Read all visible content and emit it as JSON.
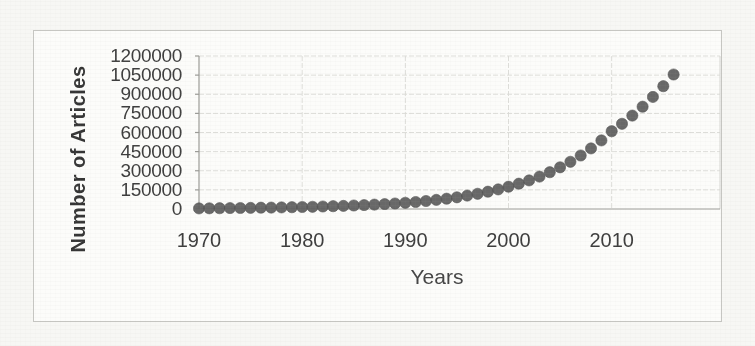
{
  "figure": {
    "page_background": "#f7f7f4",
    "frame_background": "#fcfcfa",
    "frame_border_color": "#c6c6c2"
  },
  "chart_data": {
    "type": "scatter",
    "title": "",
    "xlabel": "Years",
    "ylabel": "Number of Articles",
    "x_tick_labels": [
      "1970",
      "1980",
      "1990",
      "2000",
      "2010"
    ],
    "x_ticks": [
      1970,
      1980,
      1990,
      2000,
      2010
    ],
    "y_ticks": [
      0,
      150000,
      300000,
      450000,
      600000,
      750000,
      900000,
      1050000,
      1200000
    ],
    "y_tick_labels": [
      "0",
      "150000",
      "300000",
      "450000",
      "600000",
      "750000",
      "900000",
      "1050000",
      "1200000"
    ],
    "xlim": [
      1970,
      2020.5
    ],
    "ylim": [
      0,
      1200000
    ],
    "grid": true,
    "legend": "none",
    "marker_color": "#5d5d5d",
    "marker_edge_color": "#4e4e4e",
    "gridline_color": "#dcdcd8",
    "axis_line_color": "#9b9b97",
    "plot_border_color": "#d6d6d2",
    "text_color": "#3d3d3d",
    "series": [
      {
        "name": "Number of Articles",
        "x": [
          1970,
          1971,
          1972,
          1973,
          1974,
          1975,
          1976,
          1977,
          1978,
          1979,
          1980,
          1981,
          1982,
          1983,
          1984,
          1985,
          1986,
          1987,
          1988,
          1989,
          1990,
          1991,
          1992,
          1993,
          1994,
          1995,
          1996,
          1997,
          1998,
          1999,
          2000,
          2001,
          2002,
          2003,
          2004,
          2005,
          2006,
          2007,
          2008,
          2009,
          2010,
          2011,
          2012,
          2013,
          2014,
          2015,
          2016
        ],
        "y": [
          5000,
          5600,
          6300,
          7000,
          7900,
          8800,
          9900,
          11000,
          12300,
          13800,
          15500,
          17400,
          19500,
          21800,
          24500,
          27400,
          30700,
          34400,
          38600,
          43300,
          48500,
          55100,
          62700,
          71300,
          81000,
          92100,
          104800,
          119100,
          135400,
          154000,
          175000,
          198300,
          224600,
          254500,
          288300,
          326700,
          370100,
          419300,
          475100,
          538300,
          610000,
          668300,
          732200,
          802200,
          878900,
          963000,
          1055000
        ]
      }
    ]
  }
}
